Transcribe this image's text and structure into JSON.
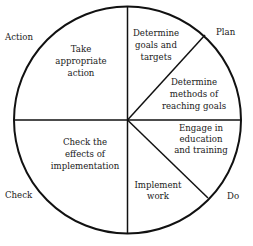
{
  "diagram": {
    "type": "pdca-cycle-pie",
    "phases": [
      {
        "id": "plan",
        "label": "Plan"
      },
      {
        "id": "do",
        "label": "Do"
      },
      {
        "id": "check",
        "label": "Check"
      },
      {
        "id": "action",
        "label": "Action"
      }
    ],
    "segments": [
      {
        "id": "take-action",
        "phase": "action",
        "lines": [
          "Take",
          "appropriate",
          "action"
        ]
      },
      {
        "id": "determine-goals",
        "phase": "plan",
        "lines": [
          "Determine",
          "goals and",
          "targets"
        ]
      },
      {
        "id": "determine-methods",
        "phase": "plan",
        "lines": [
          "Determine",
          "methods of",
          "reaching goals"
        ]
      },
      {
        "id": "engage-education",
        "phase": "do",
        "lines": [
          "Engage in",
          "education",
          "and training"
        ]
      },
      {
        "id": "implement-work",
        "phase": "do",
        "lines": [
          "Implement",
          "work"
        ]
      },
      {
        "id": "check-effects",
        "phase": "check",
        "lines": [
          "Check the",
          "effects of",
          "implementation"
        ]
      }
    ],
    "colors": {
      "stroke": "#111111",
      "background": "#ffffff",
      "text": "#1a1a1a"
    }
  }
}
